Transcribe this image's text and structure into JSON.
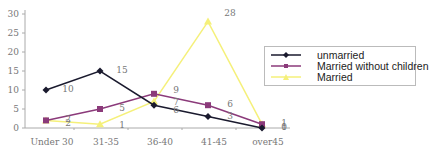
{
  "chart_data": {
    "type": "line",
    "title": "",
    "xlabel": "",
    "ylabel": "",
    "categories": [
      "Under 30",
      "31-35",
      "36-40",
      "41-45",
      "over45"
    ],
    "ylim": [
      0,
      30
    ],
    "yticks": [
      0,
      5,
      10,
      15,
      20,
      25,
      30
    ],
    "grid": false,
    "legend_position": "right",
    "series": [
      {
        "name": "unmarried",
        "color": "#1a1a2e",
        "marker": "diamond",
        "values": [
          10,
          15,
          6,
          3,
          0
        ]
      },
      {
        "name": "Married without children",
        "color": "#8b3a7a",
        "marker": "square",
        "values": [
          2,
          5,
          9,
          6,
          1
        ]
      },
      {
        "name": "Married",
        "color": "#f5f07a",
        "marker": "triangle",
        "values": [
          2,
          1,
          7,
          28,
          1
        ]
      }
    ]
  },
  "legend": {
    "items": [
      "unmarried",
      "Married without children",
      "Married"
    ]
  }
}
